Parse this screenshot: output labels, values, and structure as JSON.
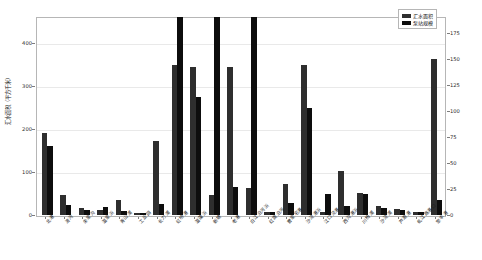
{
  "chart_data": {
    "type": "bar",
    "title": "",
    "xlabel": "",
    "ylabel": "汇水面积（平方千米）",
    "y2label": "泵站规模（参考水位）",
    "ylim": [
      0,
      460
    ],
    "y2lim": [
      0,
      190
    ],
    "yticks": [
      0,
      100,
      200,
      300,
      400
    ],
    "y2ticks": [
      0,
      25,
      50,
      75,
      100,
      125,
      150,
      175
    ],
    "grid": true,
    "legend_position": "top-right",
    "categories": [
      "北港",
      "清河",
      "朱家沟",
      "温家浜",
      "青山浦",
      "工业园",
      "长力浦",
      "虹桥港",
      "温藻浜",
      "新塘",
      "老港",
      "白江沿河浜",
      "红旗沿河",
      "曹家宅港",
      "沙泾港浜",
      "江口泾港",
      "西沟港浜",
      "川杨浦",
      "沙泾浦",
      "芦潮港",
      "虬江路港口",
      "聚丰港"
    ],
    "series": [
      {
        "name": "汇水面积",
        "axis": "left",
        "color": "#2e2e2e",
        "values": [
          190,
          47,
          16,
          11,
          36,
          5,
          173,
          348,
          344,
          47,
          344,
          63,
          8,
          72,
          349,
          7,
          103,
          52,
          21,
          15,
          8,
          362
        ]
      },
      {
        "name": "泵站规模",
        "axis": "right",
        "color": "#0d0d0d",
        "values": [
          66,
          10,
          5,
          8,
          4,
          2,
          11,
          190,
          113,
          190,
          27,
          190,
          3,
          12,
          103,
          20,
          9,
          20,
          7,
          5,
          3,
          14
        ]
      }
    ]
  },
  "legend": {
    "items": [
      {
        "label": "汇水面积",
        "color": "#2e2e2e"
      },
      {
        "label": "泵站规模",
        "color": "#0d0d0d"
      }
    ]
  },
  "axes": {
    "left_title": "汇水面积（平方千米）",
    "right_title": "泵站规模（参考水位）",
    "left_ticks": [
      "0",
      "100",
      "200",
      "300",
      "400"
    ],
    "right_ticks": [
      "0",
      "25",
      "50",
      "75",
      "100",
      "125",
      "150",
      "175"
    ]
  }
}
